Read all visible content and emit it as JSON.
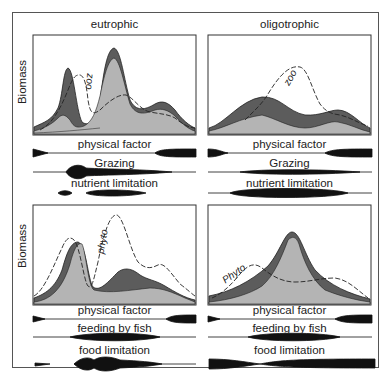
{
  "panels": {
    "top_left": {
      "title": "eutrophic",
      "y_label": "Biomass",
      "curve_label": "zoo",
      "bars": [
        {
          "label": "physical factor"
        },
        {
          "label": "Grazing"
        },
        {
          "label": "nutrient limitation"
        }
      ]
    },
    "top_right": {
      "title": "oligotrophic",
      "curve_label": "zoo",
      "bars": [
        {
          "label": "physical factor"
        },
        {
          "label": "Grazing"
        },
        {
          "label": "nutrient limitation"
        }
      ]
    },
    "bottom_left": {
      "y_label": "Biomass",
      "curve_label": "phyto",
      "bars": [
        {
          "label": "physical factor"
        },
        {
          "label": "feeding by fish"
        },
        {
          "label": "food limitation"
        }
      ]
    },
    "bottom_right": {
      "curve_label": "Phyto",
      "bars": [
        {
          "label": "physical factor"
        },
        {
          "label": "feeding by fish"
        },
        {
          "label": "food limitation"
        }
      ]
    }
  },
  "colors": {
    "dark_band": "#5a5a5a",
    "light_fill": "#b4b4b4",
    "outline": "#222222"
  }
}
